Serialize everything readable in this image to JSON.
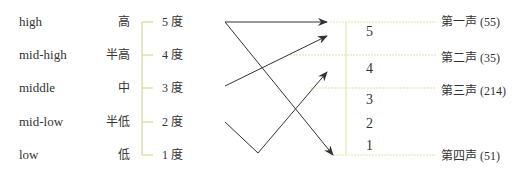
{
  "left_levels": [
    {
      "en": "high",
      "zh": "高",
      "degree": "5 度"
    },
    {
      "en": "mid-high",
      "zh": "半高",
      "degree": "4 度"
    },
    {
      "en": "middle",
      "zh": "中",
      "degree": "3 度"
    },
    {
      "en": "mid-low",
      "zh": "半低",
      "degree": "2 度"
    },
    {
      "en": "low",
      "zh": "低",
      "degree": "1 度"
    }
  ],
  "scale_numbers": [
    "5",
    "4",
    "3",
    "2",
    "1"
  ],
  "tones": [
    {
      "label": "第一声 (55)"
    },
    {
      "label": "第二声 (35)"
    },
    {
      "label": "第三声 (214)"
    },
    {
      "label": "第四声 (51)"
    }
  ],
  "colors": {
    "bracket": "#d8dca0",
    "arrow": "#333333",
    "text": "#333333"
  }
}
